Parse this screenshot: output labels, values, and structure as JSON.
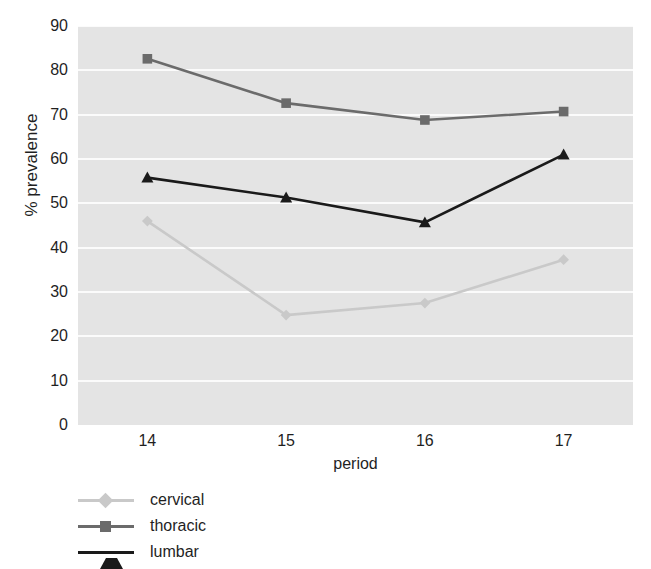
{
  "chart_data": {
    "type": "line",
    "title": "",
    "xlabel": "period",
    "ylabel": "% prevalence",
    "categories": [
      "14",
      "15",
      "16",
      "17"
    ],
    "x": [
      14,
      15,
      16,
      17
    ],
    "xlim": [
      13.5,
      17.5
    ],
    "ylim": [
      0,
      90
    ],
    "ytick_labels": [
      "0",
      "10",
      "20",
      "30",
      "40",
      "50",
      "60",
      "70",
      "80",
      "90"
    ],
    "yticks": [
      0,
      10,
      20,
      30,
      40,
      50,
      60,
      70,
      80,
      90
    ],
    "grid": "horizontal",
    "legend_position": "below-left",
    "plot_background": "#e4e4e4",
    "gridline_color": "#fbfbfb",
    "series": [
      {
        "name": "cervical",
        "color": "#c9c9c9",
        "marker": "diamond",
        "values": [
          46.0,
          24.8,
          27.5,
          37.3
        ]
      },
      {
        "name": "thoracic",
        "color": "#6b6b6b",
        "marker": "square",
        "values": [
          82.6,
          72.6,
          68.8,
          70.7
        ]
      },
      {
        "name": "lumbar",
        "color": "#1a1a1a",
        "marker": "triangle",
        "values": [
          55.8,
          51.3,
          45.7,
          61.0
        ]
      }
    ]
  }
}
